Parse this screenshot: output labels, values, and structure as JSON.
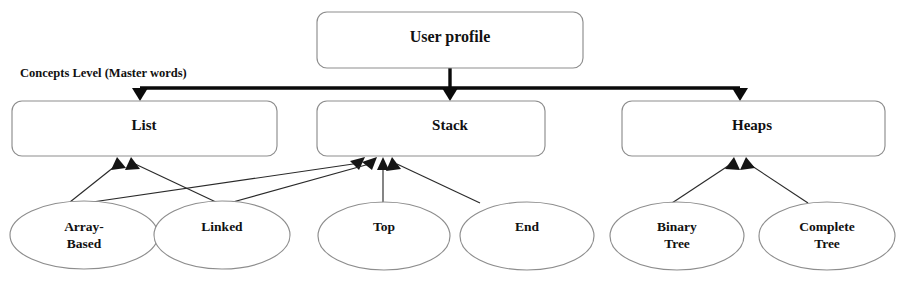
{
  "diagram": {
    "title_node": {
      "id": "user-profile",
      "label": "User profile"
    },
    "section_label": "Concepts Level (Master words)",
    "concept_boxes": [
      {
        "id": "list",
        "label": "List"
      },
      {
        "id": "stack",
        "label": "Stack"
      },
      {
        "id": "heaps",
        "label": "Heaps"
      }
    ],
    "leaf_ellipses": [
      {
        "id": "array-based",
        "line1": "Array-",
        "line2": "Based"
      },
      {
        "id": "linked",
        "line1": "Linked",
        "line2": ""
      },
      {
        "id": "top",
        "line1": "Top",
        "line2": ""
      },
      {
        "id": "end",
        "line1": "End",
        "line2": ""
      },
      {
        "id": "binary-tree",
        "line1": "Binary",
        "line2": "Tree"
      },
      {
        "id": "complete-tree",
        "line1": "Complete",
        "line2": "Tree"
      }
    ],
    "colors": {
      "background": "#ffffff",
      "shape_stroke": "#8d8d8d",
      "bus_stroke": "#0a0a0a",
      "thin_stroke": "#2a2a2a",
      "text": "#111111"
    }
  }
}
